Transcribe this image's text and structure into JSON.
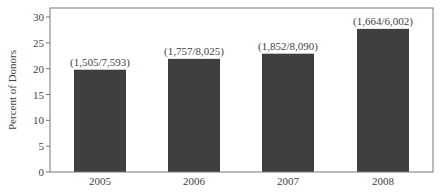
{
  "chart_data": {
    "type": "bar",
    "title": "",
    "xlabel": "",
    "ylabel": "Percent of Donors",
    "ylim": [
      0,
      30
    ],
    "yticks": [
      0,
      5,
      10,
      15,
      20,
      25,
      30
    ],
    "grid": false,
    "legend": null,
    "categories": [
      "2005",
      "2006",
      "2007",
      "2008"
    ],
    "values": [
      19.8,
      21.9,
      22.9,
      27.7
    ],
    "bar_labels": [
      "(1,505/7,593)",
      "(1,757/8,025)",
      "(1,852/8,090)",
      "(1,664/6,002)"
    ],
    "bar_color": "#3f3f3f"
  }
}
